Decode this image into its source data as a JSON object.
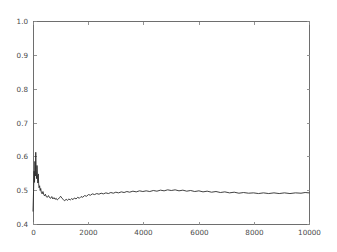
{
  "chart_data": {
    "type": "line",
    "title": "",
    "subtitle": "",
    "xlabel": "",
    "ylabel": "",
    "xlim": [
      0,
      10000
    ],
    "ylim": [
      0.4,
      1.0
    ],
    "grid": false,
    "legend": null,
    "legend_position": "none",
    "background_color": "#ffffff",
    "line_color": "#2b2b2b",
    "axis_color": "#6e6e6e",
    "tick_label_color": "#4a4a4a",
    "xticks": [
      0,
      2000,
      4000,
      6000,
      8000,
      10000
    ],
    "xtick_labels": [
      "0",
      "2000",
      "4000",
      "6000",
      "8000",
      "10000"
    ],
    "yticks": [
      0.4,
      0.5,
      0.6,
      0.7,
      0.8,
      0.9,
      1.0
    ],
    "ytick_labels": [
      "0.4",
      "0.5",
      "0.6",
      "0.7",
      "0.8",
      "0.9",
      "1.0"
    ],
    "series": [
      {
        "name": "value",
        "x": [
          0,
          20,
          40,
          55,
          70,
          85,
          100,
          115,
          130,
          145,
          160,
          175,
          190,
          205,
          220,
          240,
          260,
          280,
          300,
          330,
          360,
          390,
          420,
          450,
          480,
          520,
          560,
          600,
          640,
          680,
          720,
          760,
          800,
          840,
          880,
          920,
          960,
          1000,
          1050,
          1100,
          1150,
          1200,
          1250,
          1300,
          1350,
          1400,
          1450,
          1500,
          1560,
          1620,
          1680,
          1740,
          1800,
          1870,
          1940,
          2010,
          2080,
          2150,
          2230,
          2310,
          2390,
          2470,
          2550,
          2640,
          2730,
          2820,
          2910,
          3000,
          3100,
          3200,
          3300,
          3400,
          3500,
          3620,
          3740,
          3860,
          3980,
          4100,
          4230,
          4360,
          4490,
          4620,
          4750,
          4880,
          5010,
          5150,
          5290,
          5430,
          5570,
          5710,
          5860,
          6010,
          6160,
          6310,
          6470,
          6630,
          6790,
          6950,
          7120,
          7290,
          7460,
          7630,
          7810,
          7990,
          8170,
          8350,
          8540,
          8730,
          8920,
          9110,
          9310,
          9510,
          9710,
          9860,
          10000
        ],
        "y": [
          0.438,
          0.497,
          0.556,
          0.523,
          0.585,
          0.542,
          0.612,
          0.561,
          0.534,
          0.573,
          0.546,
          0.521,
          0.548,
          0.519,
          0.507,
          0.513,
          0.499,
          0.505,
          0.494,
          0.489,
          0.496,
          0.487,
          0.483,
          0.488,
          0.481,
          0.479,
          0.484,
          0.478,
          0.476,
          0.481,
          0.474,
          0.478,
          0.473,
          0.476,
          0.471,
          0.474,
          0.478,
          0.482,
          0.476,
          0.472,
          0.469,
          0.473,
          0.47,
          0.474,
          0.471,
          0.475,
          0.472,
          0.477,
          0.474,
          0.479,
          0.476,
          0.481,
          0.479,
          0.484,
          0.482,
          0.487,
          0.485,
          0.489,
          0.487,
          0.49,
          0.488,
          0.491,
          0.489,
          0.492,
          0.49,
          0.493,
          0.491,
          0.494,
          0.492,
          0.495,
          0.493,
          0.496,
          0.494,
          0.497,
          0.495,
          0.498,
          0.496,
          0.498,
          0.496,
          0.499,
          0.497,
          0.5,
          0.498,
          0.501,
          0.499,
          0.501,
          0.498,
          0.5,
          0.497,
          0.499,
          0.496,
          0.498,
          0.495,
          0.497,
          0.494,
          0.496,
          0.493,
          0.495,
          0.492,
          0.494,
          0.491,
          0.493,
          0.491,
          0.492,
          0.49,
          0.492,
          0.49,
          0.492,
          0.49,
          0.492,
          0.49,
          0.492,
          0.491,
          0.493,
          0.492
        ]
      }
    ]
  },
  "figure": {
    "plot_area": {
      "left": 33,
      "top": 21,
      "right": 309,
      "bottom": 224
    }
  }
}
